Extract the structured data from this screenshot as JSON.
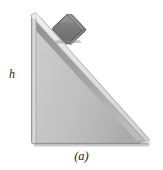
{
  "figure": {
    "caption": "(a)",
    "height_label": "h",
    "background_color": "#ffffff",
    "colors": {
      "wedge_face_light": "#d4d4d4",
      "wedge_face_mid": "#bdbdbd",
      "wedge_face_dark": "#a6a6a6",
      "wedge_top_bevel": "#e8e8e8",
      "wedge_slope_shadow": "#8f8f8f",
      "wedge_outline": "#6e6e6e",
      "block_top": "#9a9a9a",
      "block_face": "#777777",
      "block_outline": "#4f4f4f",
      "ground_shadow": "#bfbfbf",
      "text": "#231f20"
    },
    "geometry": {
      "apex": [
        31,
        15
      ],
      "bottom_left": [
        31,
        143
      ],
      "bottom_right": [
        148,
        143
      ],
      "block_center": [
        68,
        30
      ],
      "block_size": 24,
      "slope_angle_deg": 47
    },
    "parts": [
      {
        "name": "incline-wedge",
        "label": ""
      },
      {
        "name": "sliding-block",
        "label": ""
      },
      {
        "name": "vertical-height-dimension",
        "label": "h"
      }
    ]
  }
}
